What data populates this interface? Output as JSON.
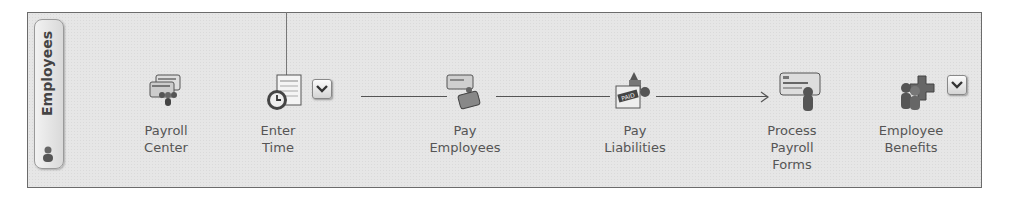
{
  "panel": {
    "tab_label": "Employees",
    "tab_icon": "person-icon"
  },
  "workflow": {
    "nodes": [
      {
        "id": "payroll-center",
        "label_lines": [
          "Payroll",
          "Center"
        ],
        "icon": "payroll-center-icon",
        "has_dropdown": false
      },
      {
        "id": "enter-time",
        "label_lines": [
          "Enter",
          "Time"
        ],
        "icon": "timesheet-clock-icon",
        "has_dropdown": true
      },
      {
        "id": "pay-employees",
        "label_lines": [
          "Pay",
          "Employees"
        ],
        "icon": "paycheck-icon",
        "has_dropdown": false
      },
      {
        "id": "pay-liabilities",
        "label_lines": [
          "Pay",
          "Liabilities"
        ],
        "icon": "paid-stamp-icon",
        "has_dropdown": false
      },
      {
        "id": "process-payroll-forms",
        "label_lines": [
          "Process",
          "Payroll",
          "Forms"
        ],
        "icon": "payroll-form-icon",
        "has_dropdown": false
      },
      {
        "id": "employee-benefits",
        "label_lines": [
          "Employee",
          "Benefits"
        ],
        "icon": "benefits-icon",
        "has_dropdown": true
      }
    ]
  },
  "colors": {
    "panel_bg": "#e6e6e6",
    "border": "#6b6b6b",
    "label_text": "#555555",
    "connector": "#555555"
  }
}
